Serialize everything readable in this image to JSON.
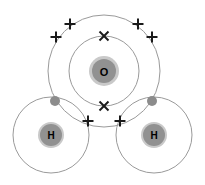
{
  "diagram": {
    "molecule_formula": "H2O",
    "background_color": "#ffffff",
    "shell_stroke_color": "#9a9a9a",
    "shell_stroke_width": 1,
    "nucleus_fill_color": "#919191",
    "nucleus_halo_color": "#c9c9c9",
    "electron_cross_color": "#1a1a1a",
    "electron_dot_color": "#8c8c8c",
    "atoms": [
      {
        "id": "oxygen",
        "symbol": "O",
        "label": "O",
        "cx": 104,
        "cy": 71,
        "nucleus_radius": 12,
        "nucleus_halo_radius": 15,
        "shells": [
          {
            "name": "inner-shell",
            "radius": 35
          },
          {
            "name": "outer-shell",
            "radius": 56
          }
        ]
      },
      {
        "id": "hydrogen-left",
        "symbol": "H",
        "label": "H",
        "cx": 51,
        "cy": 135,
        "nucleus_radius": 11,
        "nucleus_halo_radius": 13,
        "shells": [
          {
            "name": "shell",
            "radius": 38
          }
        ]
      },
      {
        "id": "hydrogen-right",
        "symbol": "H",
        "label": "H",
        "cx": 154,
        "cy": 135,
        "nucleus_radius": 11,
        "nucleus_halo_radius": 13,
        "shells": [
          {
            "name": "shell",
            "radius": 38
          }
        ]
      }
    ],
    "electrons": [
      {
        "id": "cross-o-top",
        "type": "cross",
        "owner": "oxygen",
        "shell": "inner-shell",
        "x": 104,
        "y": 36,
        "size": 10
      },
      {
        "id": "cross-o-bottom",
        "type": "cross",
        "owner": "oxygen",
        "shell": "inner-shell",
        "x": 104,
        "y": 106,
        "size": 10
      },
      {
        "id": "cross-o-upper-left-outer",
        "type": "plus",
        "owner": "oxygen",
        "shell": "outer-shell",
        "x": 56,
        "y": 37,
        "size": 11
      },
      {
        "id": "cross-o-upper-left-inner",
        "type": "plus",
        "owner": "oxygen",
        "shell": "outer-shell",
        "x": 70,
        "y": 24,
        "size": 11
      },
      {
        "id": "cross-o-upper-right-inner",
        "type": "plus",
        "owner": "oxygen",
        "shell": "outer-shell",
        "x": 138,
        "y": 24,
        "size": 11
      },
      {
        "id": "cross-o-upper-right-outer",
        "type": "plus",
        "owner": "oxygen",
        "shell": "outer-shell",
        "x": 152,
        "y": 37,
        "size": 11
      },
      {
        "id": "cross-o-bond-left",
        "type": "plus",
        "owner": "oxygen",
        "shell": "outer-shell",
        "x": 88,
        "y": 121,
        "size": 11
      },
      {
        "id": "cross-o-bond-right",
        "type": "plus",
        "owner": "oxygen",
        "shell": "outer-shell",
        "x": 120,
        "y": 121,
        "size": 11
      },
      {
        "id": "dot-h-left",
        "type": "dot",
        "owner": "hydrogen-left",
        "shell": "shell",
        "x": 55,
        "y": 101,
        "size": 5
      },
      {
        "id": "dot-h-right",
        "type": "dot",
        "owner": "hydrogen-right",
        "shell": "shell",
        "x": 152,
        "y": 101,
        "size": 5
      }
    ],
    "legend": {
      "cross_meaning": "oxygen electron",
      "dot_meaning": "hydrogen electron"
    }
  }
}
